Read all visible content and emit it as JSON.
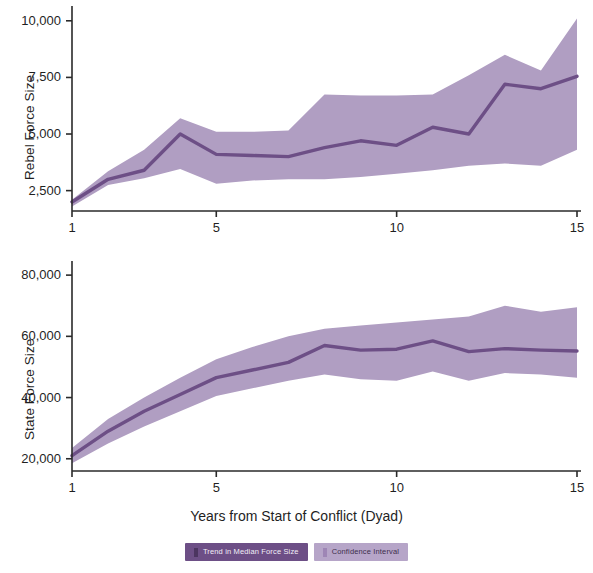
{
  "figure": {
    "x_axis_label": "Years from Start of Conflict (Dyad)"
  },
  "legend": {
    "items": [
      {
        "label": "Trend in Median Force Size",
        "color": "#6d4f86"
      },
      {
        "label": "Confidence Interval",
        "color": "#b6a5c8"
      }
    ]
  },
  "colors": {
    "line": "#6d4f86",
    "band": "#b09ec2",
    "axis": "#2a2a2a",
    "text": "#1f1f1f"
  },
  "chart_data": [
    {
      "type": "line",
      "title": "",
      "ylabel": "Rebel Force Size",
      "xlabel": "Years from Start of Conflict (Dyad)",
      "x": [
        1,
        2,
        3,
        4,
        5,
        6,
        7,
        8,
        9,
        10,
        11,
        12,
        13,
        14,
        15
      ],
      "xlim": [
        1,
        15
      ],
      "ylim": [
        1600,
        10300
      ],
      "xticks": [
        1,
        5,
        10,
        15
      ],
      "xtick_labels": [
        "1",
        "5",
        "10",
        "15"
      ],
      "yticks": [
        2500,
        5000,
        7500,
        10000
      ],
      "ytick_labels": [
        "2,500",
        "5,000",
        "7,500",
        "10,000"
      ],
      "grid": false,
      "legend_position": "bottom",
      "series": [
        {
          "name": "Trend in Median Force Size",
          "values": [
            2000,
            3000,
            3400,
            5000,
            4100,
            4050,
            4000,
            4400,
            4700,
            4500,
            5300,
            5000,
            7200,
            7000,
            7550
          ]
        },
        {
          "name": "Confidence Interval Upper",
          "values": [
            2100,
            3350,
            4300,
            5700,
            5100,
            5100,
            5150,
            6750,
            6700,
            6700,
            6750,
            7600,
            8500,
            7800,
            10100
          ]
        },
        {
          "name": "Confidence Interval Lower",
          "values": [
            1800,
            2750,
            3050,
            3450,
            2800,
            2950,
            3000,
            3000,
            3100,
            3250,
            3400,
            3600,
            3700,
            3600,
            4300
          ]
        }
      ]
    },
    {
      "type": "line",
      "title": "",
      "ylabel": "State Force Size",
      "xlabel": "Years from Start of Conflict (Dyad)",
      "x": [
        1,
        2,
        3,
        4,
        5,
        6,
        7,
        8,
        9,
        10,
        11,
        12,
        13,
        14,
        15
      ],
      "xlim": [
        1,
        15
      ],
      "ylim": [
        16000,
        82000
      ],
      "xticks": [
        1,
        5,
        10,
        15
      ],
      "xtick_labels": [
        "1",
        "5",
        "10",
        "15"
      ],
      "yticks": [
        20000,
        40000,
        60000,
        80000
      ],
      "ytick_labels": [
        "20,000",
        "40,000",
        "60,000",
        "80,000"
      ],
      "grid": false,
      "legend_position": "bottom",
      "series": [
        {
          "name": "Trend in Median Force Size",
          "values": [
            21000,
            29000,
            35500,
            41000,
            46500,
            49000,
            51500,
            57000,
            55500,
            55800,
            58500,
            55000,
            56000,
            55500,
            55200
          ]
        },
        {
          "name": "Confidence Interval Upper",
          "values": [
            23500,
            33000,
            40000,
            46500,
            52500,
            56500,
            60000,
            62500,
            63500,
            64500,
            65500,
            66500,
            70000,
            68000,
            69500
          ]
        },
        {
          "name": "Confidence Interval Lower",
          "values": [
            18500,
            25000,
            30500,
            35500,
            40500,
            43000,
            45500,
            47500,
            46000,
            45500,
            48500,
            45500,
            48000,
            47500,
            46500
          ]
        }
      ]
    }
  ]
}
